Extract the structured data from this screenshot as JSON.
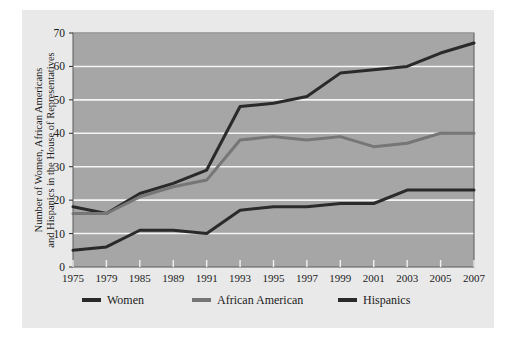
{
  "chart_data": {
    "type": "line",
    "title": "",
    "xlabel": "",
    "ylabel": "Number of Women, African Americans and Hispanics in the House of Representatives",
    "ylabel_line1": "Number of Women, African Americans",
    "ylabel_line2": "and Hispanics in the House of Representatives",
    "categories": [
      "1975",
      "1979",
      "1985",
      "1989",
      "1991",
      "1993",
      "1995",
      "1997",
      "1999",
      "2001",
      "2003",
      "2005",
      "2007"
    ],
    "ylim": [
      0,
      70
    ],
    "yticks": [
      "0",
      "10",
      "20",
      "30",
      "40",
      "50",
      "60",
      "70"
    ],
    "grid": true,
    "grid_color": "#f4f4f4",
    "plot_background": "#a6a6a6",
    "legend_position": "bottom",
    "series": [
      {
        "name": "Women",
        "color": "#2a2a2a",
        "values": [
          18,
          16,
          22,
          25,
          29,
          48,
          49,
          51,
          58,
          59,
          60,
          64,
          67
        ]
      },
      {
        "name": "African American",
        "color": "#767676",
        "values": [
          16,
          16,
          21,
          24,
          26,
          38,
          39,
          38,
          39,
          36,
          37,
          40,
          40
        ]
      },
      {
        "name": "Hispanics",
        "color": "#2a2a2a",
        "values": [
          5,
          6,
          11,
          11,
          10,
          17,
          18,
          18,
          19,
          19,
          23,
          23,
          23
        ]
      }
    ]
  },
  "legend": {
    "items": [
      {
        "label": "Women",
        "color": "#2a2a2a"
      },
      {
        "label": "African American",
        "color": "#767676"
      },
      {
        "label": "Hispanics",
        "color": "#2a2a2a"
      }
    ]
  }
}
